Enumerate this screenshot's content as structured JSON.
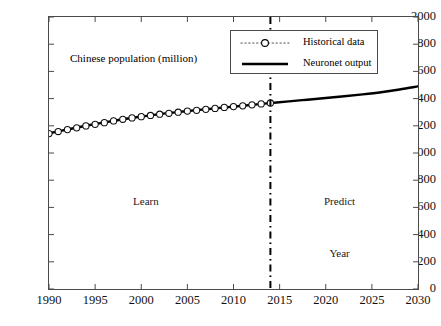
{
  "chart_data": {
    "type": "line",
    "title": "",
    "xlabel": "Year",
    "ylabel": "",
    "axis_note": "Chinese population (million)",
    "xlim": [
      1990,
      2030
    ],
    "ylim": [
      0,
      2000
    ],
    "xticks": [
      1990,
      1995,
      2000,
      2005,
      2010,
      2015,
      2020,
      2025,
      2030
    ],
    "yticks": [
      0,
      200,
      400,
      600,
      800,
      1000,
      1200,
      1400,
      1600,
      1800,
      2000
    ],
    "grid": false,
    "legend_position": "top-right",
    "divider_x": 2014,
    "series": [
      {
        "name": "Historical data",
        "style": "dotted-with-circle-markers",
        "color": "#000000",
        "x": [
          1990,
          1991,
          1992,
          1993,
          1994,
          1995,
          1996,
          1997,
          1998,
          1999,
          2000,
          2001,
          2002,
          2003,
          2004,
          2005,
          2006,
          2007,
          2008,
          2009,
          2010,
          2011,
          2012,
          2013,
          2014
        ],
        "values": [
          1143,
          1158,
          1172,
          1185,
          1199,
          1211,
          1223,
          1236,
          1248,
          1258,
          1267,
          1276,
          1285,
          1292,
          1300,
          1308,
          1314,
          1321,
          1328,
          1335,
          1341,
          1347,
          1354,
          1361,
          1368
        ]
      },
      {
        "name": "Neuronet output",
        "style": "solid-thick",
        "color": "#000000",
        "x": [
          1990,
          1992,
          1994,
          1996,
          1998,
          2000,
          2002,
          2004,
          2006,
          2008,
          2010,
          2012,
          2014,
          2016,
          2018,
          2020,
          2022,
          2024,
          2026,
          2028,
          2030
        ],
        "values": [
          1145,
          1173,
          1200,
          1225,
          1248,
          1268,
          1286,
          1301,
          1315,
          1328,
          1341,
          1354,
          1367,
          1380,
          1392,
          1404,
          1417,
          1431,
          1447,
          1467,
          1490
        ]
      }
    ],
    "annotations": [
      {
        "text": "Learn",
        "x": 2000.5,
        "y": 640
      },
      {
        "text": "Predict",
        "x": 2021.5,
        "y": 640
      },
      {
        "text": "Year",
        "x": 2021.5,
        "y": 260
      }
    ]
  },
  "legend": {
    "items": [
      {
        "label": "Historical data",
        "icon": "dotted-circle-marker-icon"
      },
      {
        "label": "Neuronet output",
        "icon": "solid-line-icon"
      }
    ]
  },
  "axis_title": "Chinese population (million)",
  "colors": {
    "axis": "#4a4a4a",
    "series": "#000000",
    "divider": "#000000",
    "background": "#ffffff"
  }
}
